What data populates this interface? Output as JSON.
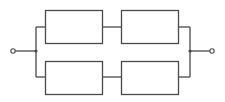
{
  "diagram": {
    "type": "reliability-block-diagram",
    "colors": {
      "line": "#4a4a4a",
      "background": "#ffffff"
    },
    "terminals": [
      {
        "id": "input",
        "cx": 13,
        "cy": 51,
        "r": 2.2
      },
      {
        "id": "output",
        "cx": 212,
        "cy": 51,
        "r": 2.2
      }
    ],
    "junctions": [
      {
        "id": "left",
        "cx": 36,
        "cy": 51,
        "r": 1.6
      },
      {
        "id": "right",
        "cx": 190,
        "cy": 51,
        "r": 1.6
      }
    ],
    "blocks": [
      {
        "id": "top-left",
        "x": 45,
        "y": 10,
        "w": 57,
        "h": 33,
        "label": ""
      },
      {
        "id": "top-right",
        "x": 121,
        "y": 10,
        "w": 57,
        "h": 33,
        "label": ""
      },
      {
        "id": "bottom-left",
        "x": 45,
        "y": 61,
        "w": 57,
        "h": 33,
        "label": ""
      },
      {
        "id": "bottom-right",
        "x": 121,
        "y": 61,
        "w": 57,
        "h": 33,
        "label": ""
      }
    ],
    "wires": [
      {
        "id": "in-lead",
        "points": "15,51 36,51"
      },
      {
        "id": "left-bus",
        "points": "36,27 36,77"
      },
      {
        "id": "left-top-stub",
        "points": "36,27 45,27"
      },
      {
        "id": "left-bottom-stub",
        "points": "36,77 45,77"
      },
      {
        "id": "top-series",
        "points": "102,27 121,27"
      },
      {
        "id": "bottom-series",
        "points": "102,77 121,77"
      },
      {
        "id": "right-top-stub",
        "points": "178,27 190,27"
      },
      {
        "id": "right-bottom-stub",
        "points": "178,77 190,77"
      },
      {
        "id": "right-bus",
        "points": "190,27 190,77"
      },
      {
        "id": "out-lead",
        "points": "190,51 210,51"
      }
    ]
  }
}
